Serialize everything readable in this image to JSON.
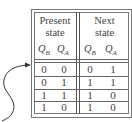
{
  "table": {
    "groups": [
      {
        "line1": "Present",
        "line2": "state"
      },
      {
        "line1": "Next",
        "line2": "state"
      }
    ],
    "columns": [
      {
        "var": "Q",
        "sub": "B"
      },
      {
        "var": "Q",
        "sub": "A"
      },
      {
        "var": "Q",
        "sub": "B"
      },
      {
        "var": "Q",
        "sub": "A"
      }
    ],
    "rows": [
      [
        "0",
        "0",
        "0",
        "1"
      ],
      [
        "0",
        "1",
        "1",
        "1"
      ],
      [
        "1",
        "1",
        "1",
        "0"
      ],
      [
        "1",
        "0",
        "1",
        "0"
      ]
    ]
  },
  "arrow": {
    "target": "first-row",
    "color": "#333333"
  }
}
